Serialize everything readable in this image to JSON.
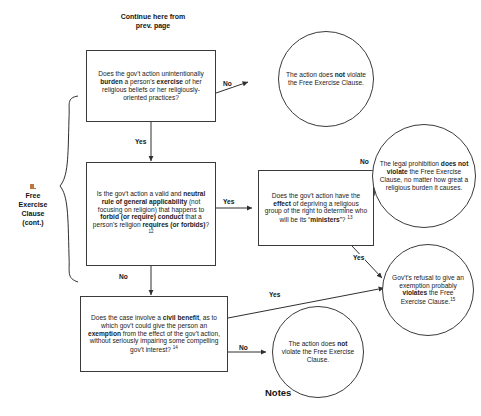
{
  "page": {
    "header_note": "Continue here from prev. page",
    "section_label": "II.\nFree\nExercise\nClause\n(cont.)",
    "notes_heading": "Notes"
  },
  "flowchart": {
    "type": "decision-flowchart",
    "title": "II. Free Exercise Clause (cont.)",
    "nodes": [
      {
        "id": "box-burden",
        "shape": "rect",
        "html": "Does the gov't action unintentionally <b>burden</b> a person's <b>exercise</b> of her religious beliefs or her religiously-oriented practices?"
      },
      {
        "id": "box-neutral",
        "shape": "rect",
        "html": "Is the gov't action a valid and <b>neutral rule of general applicability</b> (not focusing on religion) that happens to <b>forbid (or require) conduct</b> that a person's religion <b>requires (or forbids)</b>?<sup>12</sup>"
      },
      {
        "id": "box-ministers",
        "shape": "rect",
        "html": "Does the gov't action have the <b>effect</b> of depriving a religious group of the right to determine who will be its &ldquo;<b>ministers</b>&rdquo;? <sup>13</sup>"
      },
      {
        "id": "box-civil",
        "shape": "rect",
        "html": "Does the case involve a <b>civil benefit</b>, as to which gov't could give the person an <b>exemption</b> from the effect of the gov't action, without seriously impairing some compelling gov't interest? <sup>14</sup>"
      },
      {
        "id": "circ-no1",
        "shape": "circle",
        "html": "The action does <b>not</b> violate the Free Exercise Clause."
      },
      {
        "id": "circ-legal",
        "shape": "circle",
        "html": "The legal prohibition <b>does not violate</b> the Free Exercise Clause, no matter how great a religious burden it causes."
      },
      {
        "id": "circ-refusal",
        "shape": "circle",
        "html": "Gov't's refusal to give an exemption probably <b>violates</b> the Free Exercise Clause.<sup>15</sup>"
      },
      {
        "id": "circ-no2",
        "shape": "circle",
        "html": "The action does <b>not</b> violate the Free Exercise Clause."
      }
    ],
    "edges": [
      {
        "id": "lbl-no-1",
        "label": "No",
        "from": "box-burden",
        "to": "circ-no1"
      },
      {
        "id": "lbl-yes-1",
        "label": "Yes",
        "from": "box-burden",
        "to": "box-neutral"
      },
      {
        "id": "lbl-yes-2",
        "label": "Yes",
        "from": "box-neutral",
        "to": "box-ministers"
      },
      {
        "id": "lbl-no-2",
        "label": "No",
        "from": "box-ministers",
        "to": "circ-legal"
      },
      {
        "id": "lbl-yes-3",
        "label": "Yes",
        "from": "box-ministers",
        "to": "circ-refusal"
      },
      {
        "id": "lbl-no-3",
        "label": "No",
        "from": "box-neutral",
        "to": "box-civil"
      },
      {
        "id": "lbl-yes-4",
        "label": "Yes",
        "from": "box-civil",
        "to": "circ-refusal"
      },
      {
        "id": "lbl-no-4",
        "label": "No",
        "from": "box-civil",
        "to": "circ-no2"
      }
    ]
  },
  "colors": {
    "stroke": "#3a3a3a",
    "text": "#1b1b1b",
    "background": "#ffffff"
  }
}
